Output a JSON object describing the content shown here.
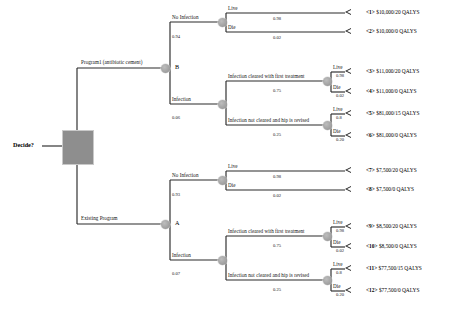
{
  "figure": {
    "type": "decision-tree",
    "root_label": "Decide?",
    "node_b_name": "B",
    "node_a_name": "A"
  },
  "labels": {
    "program1": "Program1 (antibiotic cement)",
    "existing": "Existing Program",
    "no_infection": "No Infection",
    "infection": "Infection",
    "cleared_first": "Infection cleared with first treatment",
    "not_cleared": "Infection not cleared and hip is revised",
    "live": "Live",
    "die": "Die"
  },
  "probabilities": {
    "p_program1_no_infection": "0.94",
    "p_program1_infection": "0.06",
    "p_existing_no_infection": "0.93",
    "p_existing_infection": "0.07",
    "p_cleared_first": "0.75",
    "p_not_cleared": "0.25",
    "p_live_98": "0.98",
    "p_die_02": "0.02",
    "p_live_80": "0.8",
    "p_die_20": "0.20"
  },
  "terminals": [
    {
      "id": "<1>",
      "value": "$10,000/20 QALYS"
    },
    {
      "id": "<2>",
      "value": "$10,000/0 QALYS"
    },
    {
      "id": "<3>",
      "value": "$11,000/20 QALYS"
    },
    {
      "id": "<4>",
      "value": "$11,000/0 QALYS"
    },
    {
      "id": "<5>",
      "value": "$81,000/15 QALYS"
    },
    {
      "id": "<6>",
      "value": "$81,000/0 QALYS"
    },
    {
      "id": "<7>",
      "value": "$7,500/20 QALYS"
    },
    {
      "id": "<8>",
      "value": "$7,500/0 QALYS"
    },
    {
      "id": "<9>",
      "value": "$8,500/20 QALYS"
    },
    {
      "id": "<10>",
      "value": "$8,500/0 QALYS"
    },
    {
      "id": "<11>",
      "value": "$77,500/15 QALYS"
    },
    {
      "id": "<12>",
      "value": "$77,500/0 QALYS"
    }
  ],
  "colors": {
    "line": "#2b2b2b",
    "chance_node": "#a9a9a9",
    "decision_node": "#8e8e8e",
    "text": "#111111"
  }
}
